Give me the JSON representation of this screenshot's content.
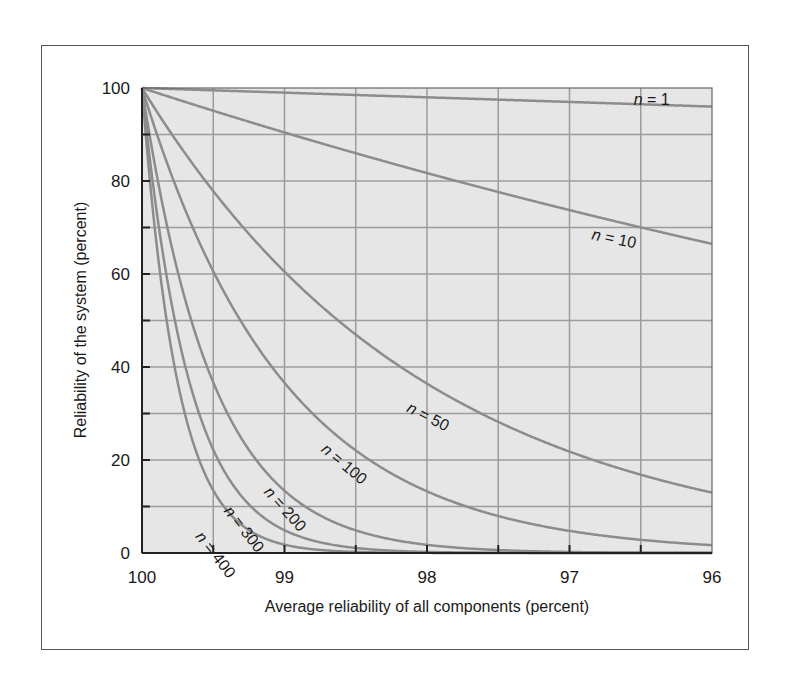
{
  "chart_data": {
    "type": "line",
    "title": "",
    "xlabel": "Average reliability of all components (percent)",
    "ylabel": "Reliability of the system (percent)",
    "xlim": [
      100,
      96
    ],
    "ylim": [
      0,
      100
    ],
    "x_ticks": [
      "100",
      "99",
      "98",
      "97",
      "96"
    ],
    "y_ticks": [
      "0",
      "20",
      "40",
      "60",
      "80",
      "100"
    ],
    "grid": true,
    "x": [
      100,
      99.5,
      99,
      98.5,
      98,
      97.5,
      97,
      96.5,
      96
    ],
    "series": [
      {
        "name": "n = 1",
        "values": [
          100,
          99.5,
          99.0,
          98.5,
          98.0,
          97.5,
          97.0,
          96.5,
          96.0
        ],
        "label_pos": {
          "x": 96.55,
          "y": 96.3,
          "angle": 0
        }
      },
      {
        "name": "n = 10",
        "values": [
          100,
          95.1,
          90.4,
          86.0,
          81.7,
          77.6,
          73.7,
          70.0,
          66.5
        ],
        "label_pos": {
          "x": 96.85,
          "y": 67.5,
          "angle": 12
        }
      },
      {
        "name": "n = 50",
        "values": [
          100,
          77.8,
          60.5,
          47.0,
          36.4,
          28.2,
          21.8,
          16.9,
          13.0
        ],
        "label_pos": {
          "x": 98.15,
          "y": 30.5,
          "angle": 27
        }
      },
      {
        "name": "n = 100",
        "values": [
          100,
          60.6,
          36.6,
          22.1,
          13.3,
          7.9,
          4.8,
          2.8,
          1.7
        ],
        "label_pos": {
          "x": 98.75,
          "y": 22.0,
          "angle": 40
        }
      },
      {
        "name": "n = 200",
        "values": [
          100,
          36.7,
          13.4,
          4.9,
          1.8,
          0.6,
          0.2,
          0.1,
          0.0
        ],
        "label_pos": {
          "x": 99.15,
          "y": 13.0,
          "angle": 48
        }
      },
      {
        "name": "n = 300",
        "values": [
          100,
          22.2,
          4.9,
          1.1,
          0.2,
          0.1,
          0.0,
          0.0,
          0.0
        ],
        "label_pos": {
          "x": 99.43,
          "y": 9.0,
          "angle": 52
        }
      },
      {
        "name": "n = 400",
        "values": [
          100,
          13.5,
          1.8,
          0.2,
          0.0,
          0.0,
          0.0,
          0.0,
          0.0
        ],
        "label_pos": {
          "x": 99.63,
          "y": 3.5,
          "angle": 52
        }
      }
    ]
  },
  "colors": {
    "plot_background": "#e6e6e6",
    "gridline": "#9c9c9c",
    "curve": "#8c8c8c",
    "axis": "#222222"
  }
}
